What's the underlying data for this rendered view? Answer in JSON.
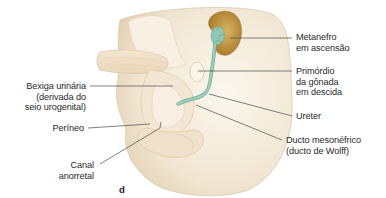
{
  "figure": {
    "panel_letter": "d",
    "colors": {
      "tissue_light": "#f6efe2",
      "tissue_mid": "#eedfc8",
      "tissue_shadow": "#d9c6a8",
      "kidney": "#c9a24f",
      "kidney_dark": "#a97d2c",
      "duct_green": "#8fc7b5",
      "duct_green_dark": "#6aa893",
      "leader_line": "#4a4a4a",
      "text": "#2a2a2a"
    }
  },
  "labels": {
    "metanefro": {
      "lines": [
        "Metanefro",
        "em ascensão"
      ]
    },
    "primordio": {
      "lines": [
        "Primórdio",
        "da gônada",
        "em descida"
      ]
    },
    "ureter": {
      "lines": [
        "Ureter"
      ]
    },
    "ducto_mesonefrico": {
      "lines": [
        "Ducto mesonéfrico",
        "(ducto de Wolff)"
      ]
    },
    "bexiga": {
      "lines": [
        "Bexiga urinária",
        "(derivada do",
        "seio urogenital)"
      ]
    },
    "perineo": {
      "lines": [
        "Períneo"
      ]
    },
    "canal_anorretal": {
      "lines": [
        "Canal",
        "anorretal"
      ]
    }
  }
}
